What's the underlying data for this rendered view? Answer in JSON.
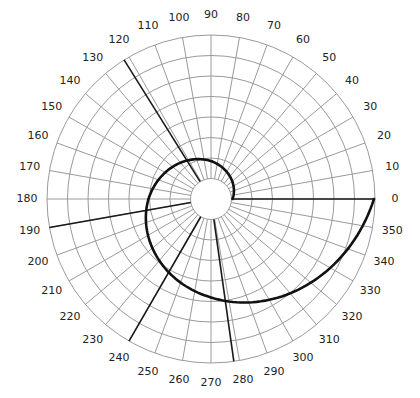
{
  "chart_data": {
    "type": "line",
    "subtype": "polar",
    "title": "",
    "angle_unit": "degrees",
    "angle_direction": "counterclockwise",
    "angle_zero": "right",
    "angular_ticks": [
      0,
      10,
      20,
      30,
      40,
      50,
      60,
      70,
      80,
      90,
      100,
      110,
      120,
      130,
      140,
      150,
      160,
      170,
      180,
      190,
      200,
      210,
      220,
      230,
      240,
      250,
      260,
      270,
      280,
      290,
      300,
      310,
      320,
      330,
      340,
      350
    ],
    "radial_rings": 8,
    "radial_range": [
      1,
      8
    ],
    "inner_hole_ring": 1,
    "grid": true,
    "series": [
      {
        "name": "spiral",
        "kind": "logarithmic spiral",
        "points": [
          {
            "theta": 0,
            "r": 1.05
          },
          {
            "theta": 90,
            "r": 1.85
          },
          {
            "theta": 180,
            "r": 3.05
          },
          {
            "theta": 270,
            "r": 4.8
          },
          {
            "theta": 360,
            "r": 7.95
          }
        ],
        "color": "#111111"
      }
    ],
    "reference_lines": [
      {
        "theta": 0,
        "r_from": 1,
        "r_to": 8
      },
      {
        "theta": 122,
        "r_from": 1,
        "r_to": 8
      },
      {
        "theta": 190,
        "r_from": 1,
        "r_to": 8
      },
      {
        "theta": 240,
        "r_from": 1,
        "r_to": 8
      },
      {
        "theta": 278,
        "r_from": 1,
        "r_to": 8
      }
    ],
    "colors": {
      "grid": "#9a9a9a",
      "curve": "#111111",
      "reference": "#1a1a1a",
      "labels": "#222222"
    }
  }
}
